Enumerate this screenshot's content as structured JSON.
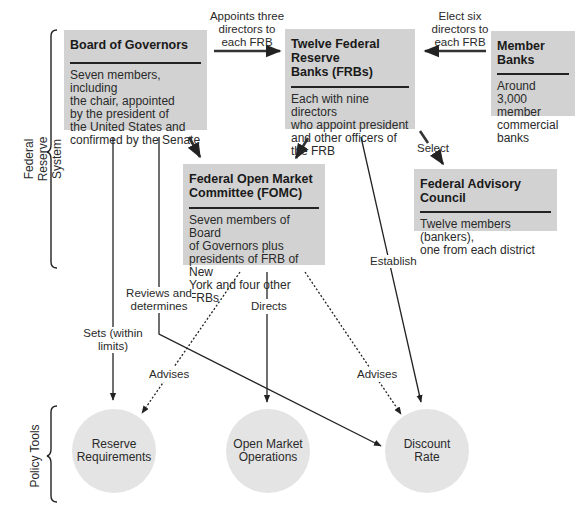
{
  "diagram": {
    "type": "organizational-flow",
    "groups": {
      "federal_reserve_system": "Federal Reserve System",
      "policy_tools": "Policy Tools"
    },
    "boxes": {
      "board": {
        "title": "Board of Governors",
        "body": "Seven members, including the chair, appointed by the president of the United States and confirmed by the Senate",
        "lines": [
          "Seven members, including",
          "the chair, appointed",
          "by the president of",
          "the United States and",
          "confirmed by the Senate"
        ]
      },
      "frbs": {
        "title_lines": [
          "Twelve Federal Reserve",
          "Banks (FRBs)"
        ],
        "lines": [
          "Each with nine directors",
          "who appoint president",
          "and other officers of",
          "the FRB"
        ]
      },
      "member_banks": {
        "title": "Member Banks",
        "lines": [
          "Around 3,000",
          "member",
          "commercial",
          "banks"
        ]
      },
      "fomc": {
        "title_lines": [
          "Federal Open Market",
          "Committee (FOMC)"
        ],
        "lines": [
          "Seven members of Board",
          "of Governors plus",
          "presidents of FRB of New",
          "York and four other FRBs"
        ]
      },
      "advisory_council": {
        "title": "Federal Advisory Council",
        "lines": [
          "Twelve members (bankers),",
          "one from each district"
        ]
      }
    },
    "tools": {
      "reserve_requirements": [
        "Reserve",
        "Requirements"
      ],
      "open_market_operations": [
        "Open Market",
        "Operations"
      ],
      "discount_rate": [
        "Discount",
        "Rate"
      ]
    },
    "edge_labels": {
      "appoints": [
        "Appoints three",
        "directors to",
        "each FRB"
      ],
      "elect": [
        "Elect six",
        "directors to",
        "each FRB"
      ],
      "select": "Select",
      "establish": "Establish",
      "reviews": [
        "Reviews and",
        "determines"
      ],
      "sets": [
        "Sets (within",
        "limits)"
      ],
      "directs": "Directs",
      "advises_left": "Advises",
      "advises_right": "Advises"
    },
    "edges": [
      {
        "from": "Board of Governors",
        "to": "Twelve Federal Reserve Banks (FRBs)",
        "label": "Appoints three directors to each FRB",
        "style": "solid"
      },
      {
        "from": "Member Banks",
        "to": "Twelve Federal Reserve Banks (FRBs)",
        "label": "Elect six directors to each FRB",
        "style": "solid"
      },
      {
        "from": "Twelve Federal Reserve Banks (FRBs)",
        "to": "Federal Advisory Council",
        "label": "Select",
        "style": "solid"
      },
      {
        "from": "Board of Governors",
        "to": "Federal Open Market Committee (FOMC)",
        "label": "",
        "style": "solid"
      },
      {
        "from": "Twelve Federal Reserve Banks (FRBs)",
        "to": "Federal Open Market Committee (FOMC)",
        "label": "",
        "style": "solid"
      },
      {
        "from": "Board of Governors",
        "to": "Reserve Requirements",
        "label": "Sets (within limits)",
        "style": "solid"
      },
      {
        "from": "Board of Governors",
        "to": "Discount Rate",
        "label": "Reviews and determines",
        "style": "solid"
      },
      {
        "from": "Twelve Federal Reserve Banks (FRBs)",
        "to": "Discount Rate",
        "label": "Establish",
        "style": "solid"
      },
      {
        "from": "Federal Open Market Committee (FOMC)",
        "to": "Open Market Operations",
        "label": "Directs",
        "style": "solid"
      },
      {
        "from": "Federal Open Market Committee (FOMC)",
        "to": "Reserve Requirements",
        "label": "Advises",
        "style": "dashed"
      },
      {
        "from": "Federal Open Market Committee (FOMC)",
        "to": "Discount Rate",
        "label": "Advises",
        "style": "dashed"
      }
    ]
  }
}
